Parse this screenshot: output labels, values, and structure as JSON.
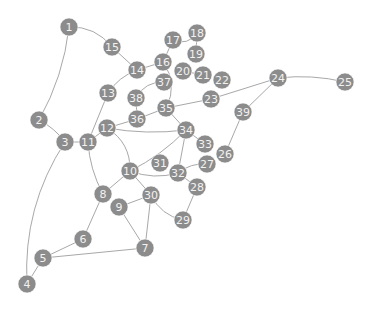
{
  "graph": {
    "node_color": "#8c8c8c",
    "edge_color": "#a8a8a8",
    "label_color": "#f2f2f2",
    "node_radius": 9,
    "nodes": [
      {
        "id": "1",
        "x": 69,
        "y": 27
      },
      {
        "id": "2",
        "x": 39,
        "y": 120
      },
      {
        "id": "3",
        "x": 65,
        "y": 142
      },
      {
        "id": "4",
        "x": 27,
        "y": 284
      },
      {
        "id": "5",
        "x": 43,
        "y": 258
      },
      {
        "id": "6",
        "x": 83,
        "y": 239
      },
      {
        "id": "7",
        "x": 145,
        "y": 248
      },
      {
        "id": "8",
        "x": 103,
        "y": 194
      },
      {
        "id": "9",
        "x": 119,
        "y": 207
      },
      {
        "id": "10",
        "x": 130,
        "y": 171
      },
      {
        "id": "11",
        "x": 88,
        "y": 142
      },
      {
        "id": "12",
        "x": 107,
        "y": 128
      },
      {
        "id": "13",
        "x": 108,
        "y": 93
      },
      {
        "id": "14",
        "x": 137,
        "y": 70
      },
      {
        "id": "15",
        "x": 112,
        "y": 47
      },
      {
        "id": "16",
        "x": 163,
        "y": 62
      },
      {
        "id": "17",
        "x": 173,
        "y": 40
      },
      {
        "id": "18",
        "x": 197,
        "y": 33
      },
      {
        "id": "19",
        "x": 196,
        "y": 54
      },
      {
        "id": "20",
        "x": 183,
        "y": 71
      },
      {
        "id": "21",
        "x": 203,
        "y": 75
      },
      {
        "id": "22",
        "x": 222,
        "y": 80
      },
      {
        "id": "23",
        "x": 211,
        "y": 99
      },
      {
        "id": "24",
        "x": 278,
        "y": 78
      },
      {
        "id": "25",
        "x": 345,
        "y": 82
      },
      {
        "id": "26",
        "x": 225,
        "y": 154
      },
      {
        "id": "27",
        "x": 207,
        "y": 164
      },
      {
        "id": "28",
        "x": 197,
        "y": 187
      },
      {
        "id": "29",
        "x": 183,
        "y": 220
      },
      {
        "id": "30",
        "x": 151,
        "y": 195
      },
      {
        "id": "31",
        "x": 160,
        "y": 163
      },
      {
        "id": "32",
        "x": 178,
        "y": 173
      },
      {
        "id": "33",
        "x": 205,
        "y": 144
      },
      {
        "id": "34",
        "x": 186,
        "y": 130
      },
      {
        "id": "35",
        "x": 166,
        "y": 108
      },
      {
        "id": "36",
        "x": 137,
        "y": 119
      },
      {
        "id": "37",
        "x": 164,
        "y": 82
      },
      {
        "id": "38",
        "x": 136,
        "y": 98
      },
      {
        "id": "39",
        "x": 243,
        "y": 112
      }
    ],
    "edges": [
      {
        "source": "1",
        "target": "15",
        "curve": -12
      },
      {
        "source": "1",
        "target": "2",
        "curve": -10
      },
      {
        "source": "15",
        "target": "14",
        "curve": 0
      },
      {
        "source": "14",
        "target": "16",
        "curve": 0
      },
      {
        "source": "14",
        "target": "13",
        "curve": 6
      },
      {
        "source": "16",
        "target": "17",
        "curve": 0
      },
      {
        "source": "17",
        "target": "18",
        "curve": 10
      },
      {
        "source": "18",
        "target": "19",
        "curve": 0
      },
      {
        "source": "16",
        "target": "35",
        "curve": -14
      },
      {
        "source": "20",
        "target": "21",
        "curve": 0
      },
      {
        "source": "37",
        "target": "38",
        "curve": 10
      },
      {
        "source": "38",
        "target": "36",
        "curve": 0
      },
      {
        "source": "36",
        "target": "12",
        "curve": 0
      },
      {
        "source": "36",
        "target": "35",
        "curve": 0
      },
      {
        "source": "35",
        "target": "34",
        "curve": 0
      },
      {
        "source": "35",
        "target": "23",
        "curve": 0
      },
      {
        "source": "23",
        "target": "24",
        "curve": 0
      },
      {
        "source": "24",
        "target": "25",
        "curve": -6
      },
      {
        "source": "24",
        "target": "39",
        "curve": 0
      },
      {
        "source": "39",
        "target": "26",
        "curve": 0
      },
      {
        "source": "2",
        "target": "3",
        "curve": -4
      },
      {
        "source": "3",
        "target": "11",
        "curve": 0
      },
      {
        "source": "3",
        "target": "4",
        "curve": 24
      },
      {
        "source": "13",
        "target": "11",
        "curve": 0
      },
      {
        "source": "11",
        "target": "12",
        "curve": 0
      },
      {
        "source": "11",
        "target": "8",
        "curve": 6
      },
      {
        "source": "12",
        "target": "34",
        "curve": 6
      },
      {
        "source": "12",
        "target": "10",
        "curve": -14
      },
      {
        "source": "10",
        "target": "34",
        "curve": 6
      },
      {
        "source": "10",
        "target": "32",
        "curve": 8
      },
      {
        "source": "10",
        "target": "8",
        "curve": 0
      },
      {
        "source": "10",
        "target": "30",
        "curve": 0
      },
      {
        "source": "34",
        "target": "33",
        "curve": 0
      },
      {
        "source": "34",
        "target": "32",
        "curve": 0
      },
      {
        "source": "32",
        "target": "27",
        "curve": -6
      },
      {
        "source": "32",
        "target": "28",
        "curve": 0
      },
      {
        "source": "28",
        "target": "29",
        "curve": 0
      },
      {
        "source": "30",
        "target": "29",
        "curve": 10
      },
      {
        "source": "30",
        "target": "9",
        "curve": 0
      },
      {
        "source": "30",
        "target": "7",
        "curve": 0
      },
      {
        "source": "9",
        "target": "7",
        "curve": 0
      },
      {
        "source": "8",
        "target": "6",
        "curve": 0
      },
      {
        "source": "6",
        "target": "5",
        "curve": 0
      },
      {
        "source": "5",
        "target": "7",
        "curve": 0
      },
      {
        "source": "5",
        "target": "4",
        "curve": 0
      }
    ]
  }
}
